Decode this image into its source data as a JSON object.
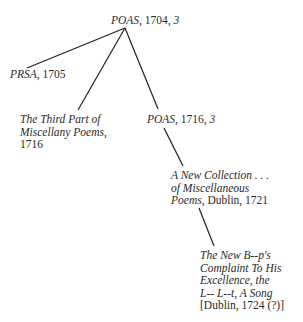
{
  "diagram": {
    "type": "stemma",
    "nodes": {
      "root": {
        "title": "POAS",
        "rest": ", 1704, ",
        "num": "3"
      },
      "prsa": {
        "title": "PRSA",
        "rest": ", 1705"
      },
      "third_part": {
        "lines": [
          "The Third Part of",
          "Miscellany Poems,"
        ],
        "date": "1716"
      },
      "poas1716": {
        "title": "POAS",
        "rest": ", 1716, ",
        "num": "3"
      },
      "new_collection": {
        "line1": "A New Collection . . .",
        "line2": "of Miscellaneous",
        "line3_title": "Poems",
        "line3_rest": ", Dublin, 1721"
      },
      "new_bp": {
        "lines": [
          "The New B--p's",
          "Complaint To His",
          "Excellence, the",
          "L-- L--t, A Song"
        ],
        "imprint": "[Dublin, 1724 (?)]"
      }
    },
    "edges": [
      {
        "from": "root",
        "to": "prsa"
      },
      {
        "from": "root",
        "to": "third_part"
      },
      {
        "from": "root",
        "to": "poas1716"
      },
      {
        "from": "poas1716",
        "to": "new_collection"
      },
      {
        "from": "new_collection",
        "to": "new_bp"
      }
    ],
    "line_color": "#222222"
  }
}
